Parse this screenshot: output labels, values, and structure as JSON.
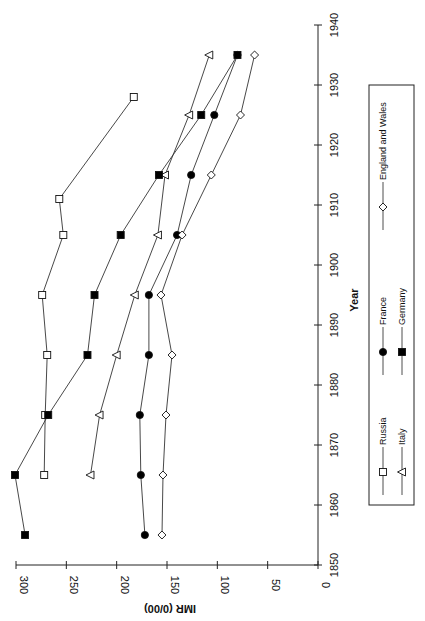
{
  "chart_data": {
    "type": "line",
    "orientation": "rotated-90",
    "title": "",
    "xlabel": "Year",
    "ylabel": "IMR (0/00)",
    "xlim": [
      1850,
      1940
    ],
    "ylim": [
      0,
      300
    ],
    "x_ticks": [
      1850,
      1860,
      1870,
      1880,
      1890,
      1900,
      1910,
      1920,
      1930,
      1940
    ],
    "y_ticks": [
      0,
      50,
      100,
      150,
      200,
      250,
      300
    ],
    "grid": false,
    "legend_position": "right-side box",
    "series": [
      {
        "name": "Russia",
        "marker": "open-square",
        "points": [
          [
            1865,
            272
          ],
          [
            1875,
            271
          ],
          [
            1885,
            269
          ],
          [
            1895,
            274
          ],
          [
            1905,
            253
          ],
          [
            1911,
            257
          ],
          [
            1928,
            183
          ]
        ]
      },
      {
        "name": "Italy",
        "marker": "open-triangle",
        "points": [
          [
            1865,
            226
          ],
          [
            1875,
            217
          ],
          [
            1885,
            200
          ],
          [
            1895,
            182
          ],
          [
            1905,
            159
          ],
          [
            1915,
            152
          ],
          [
            1925,
            128
          ],
          [
            1935,
            108
          ]
        ]
      },
      {
        "name": "France",
        "marker": "filled-circle",
        "points": [
          [
            1855,
            172
          ],
          [
            1865,
            176
          ],
          [
            1875,
            177
          ],
          [
            1885,
            168
          ],
          [
            1895,
            168
          ],
          [
            1905,
            140
          ],
          [
            1915,
            126
          ],
          [
            1925,
            103
          ],
          [
            1935,
            80
          ]
        ]
      },
      {
        "name": "Germany",
        "marker": "filled-square",
        "points": [
          [
            1855,
            291
          ],
          [
            1865,
            301
          ],
          [
            1875,
            268
          ],
          [
            1885,
            229
          ],
          [
            1895,
            222
          ],
          [
            1905,
            196
          ],
          [
            1915,
            158
          ],
          [
            1925,
            116
          ],
          [
            1935,
            80
          ]
        ]
      },
      {
        "name": "England and Wales",
        "marker": "open-diamond",
        "points": [
          [
            1855,
            155
          ],
          [
            1865,
            154
          ],
          [
            1875,
            151
          ],
          [
            1885,
            145
          ],
          [
            1895,
            156
          ],
          [
            1905,
            135
          ],
          [
            1915,
            106
          ],
          [
            1925,
            77
          ],
          [
            1935,
            63
          ]
        ]
      }
    ]
  },
  "axes": {
    "year_title": "Year",
    "imr_title": "IMR (0/00)"
  },
  "legend": {
    "items": [
      {
        "label": "Russia",
        "marker": "open-square"
      },
      {
        "label": "Italy",
        "marker": "open-triangle"
      },
      {
        "label": "France",
        "marker": "filled-circle"
      },
      {
        "label": "Germany",
        "marker": "filled-square"
      },
      {
        "label": "England and Wales",
        "marker": "open-diamond"
      }
    ]
  }
}
